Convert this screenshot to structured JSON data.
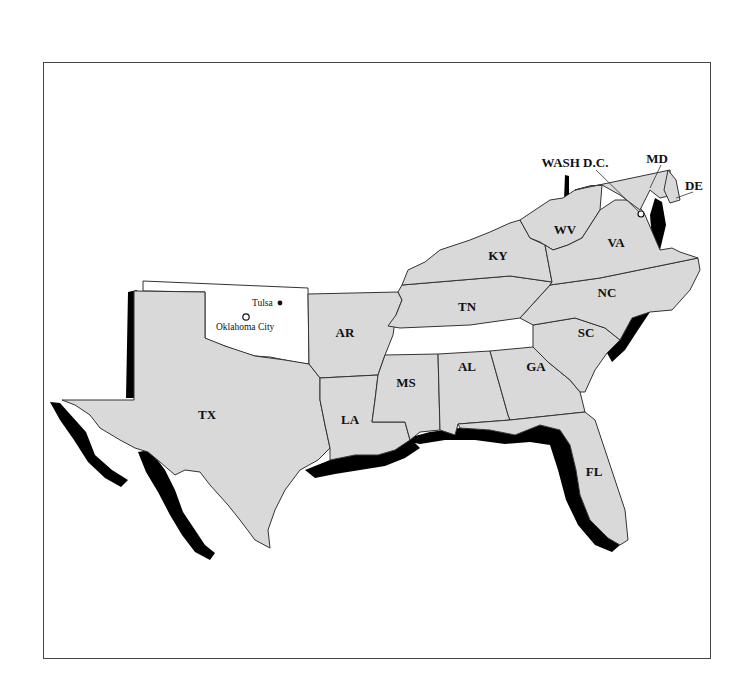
{
  "map": {
    "region": "Southeastern United States",
    "fill_color": "#d9d9d9",
    "highlight_color": "#ffffff",
    "coast_shading_color": "#000000",
    "states": [
      {
        "abbr": "TX",
        "x": 207,
        "y": 419
      },
      {
        "abbr": "LA",
        "x": 350,
        "y": 424
      },
      {
        "abbr": "AR",
        "x": 345,
        "y": 337
      },
      {
        "abbr": "MS",
        "x": 406,
        "y": 387
      },
      {
        "abbr": "AL",
        "x": 467,
        "y": 371
      },
      {
        "abbr": "GA",
        "x": 536,
        "y": 371
      },
      {
        "abbr": "FL",
        "x": 594,
        "y": 476
      },
      {
        "abbr": "SC",
        "x": 586,
        "y": 337
      },
      {
        "abbr": "NC",
        "x": 607,
        "y": 293
      },
      {
        "abbr": "TN",
        "x": 467,
        "y": 307
      },
      {
        "abbr": "KY",
        "x": 498,
        "y": 256
      },
      {
        "abbr": "WV",
        "x": 565,
        "y": 230
      },
      {
        "abbr": "VA",
        "x": 616,
        "y": 243
      }
    ],
    "callouts": [
      {
        "label": "WASH D.C.",
        "x": 575,
        "y": 163
      },
      {
        "label": "MD",
        "x": 657,
        "y": 159
      },
      {
        "label": "DE",
        "x": 694,
        "y": 186
      }
    ],
    "highlighted_state": {
      "name": "Oklahoma",
      "cities": [
        {
          "name": "Tulsa",
          "x": 252,
          "y": 306,
          "marker": "dot"
        },
        {
          "name": "Oklahoma City",
          "x": 216,
          "y": 330,
          "marker": "star-circle"
        }
      ]
    }
  }
}
